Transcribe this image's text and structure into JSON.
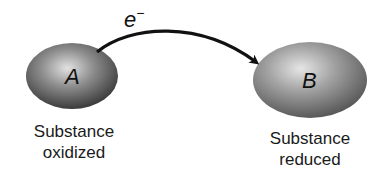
{
  "diagram": {
    "type": "electron-transfer",
    "electron_label": "e",
    "electron_charge": "−",
    "donor": {
      "symbol": "A",
      "caption_line1": "Substance",
      "caption_line2": "oxidized"
    },
    "acceptor": {
      "symbol": "B",
      "caption_line1": "Substance",
      "caption_line2": "reduced"
    },
    "arrow_direction": "A-to-B",
    "colors": {
      "sphere_light": "#d8d8d8",
      "sphere_dark": "#4a4a4a",
      "arrow": "#111111",
      "text": "#1a1a1a"
    }
  }
}
